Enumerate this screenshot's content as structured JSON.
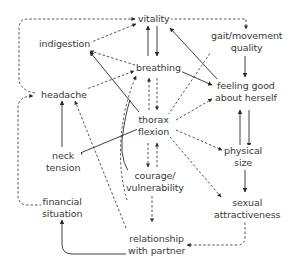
{
  "diagram": {
    "type": "causal concept map",
    "nodes": {
      "vitality": {
        "label": "vitality"
      },
      "indigestion": {
        "label": "indigestion"
      },
      "breathing": {
        "label": "breathing"
      },
      "headache": {
        "label": "headache"
      },
      "gait": {
        "line1": "gait/movement",
        "line2": "quality"
      },
      "feeling_good": {
        "line1": "feeling good",
        "line2": "about herself"
      },
      "thorax": {
        "line1": "thorax",
        "line2": "flexion"
      },
      "neck": {
        "line1": "neck",
        "line2": "tension"
      },
      "physical_size": {
        "line1": "physical",
        "line2": "size"
      },
      "courage": {
        "line1": "courage/",
        "line2": "vulnerability"
      },
      "financial": {
        "line1": "financial",
        "line2": "situation"
      },
      "sexual": {
        "line1": "sexual",
        "line2": "attractiveness"
      },
      "relationship": {
        "line1": "relationship",
        "line2": "with partner"
      }
    },
    "edges": [
      {
        "from": "breathing",
        "to": "vitality",
        "style": "solid"
      },
      {
        "from": "vitality",
        "to": "breathing",
        "style": "solid"
      },
      {
        "from": "breathing",
        "to": "indigestion",
        "style": "dashed"
      },
      {
        "from": "indigestion",
        "to": "vitality",
        "style": "dashed"
      },
      {
        "from": "headache",
        "to": "breathing",
        "style": "dashed"
      },
      {
        "from": "headache",
        "to": "vitality",
        "style": "dashed"
      },
      {
        "from": "vitality",
        "to": "gait/movement quality",
        "style": "dashed"
      },
      {
        "from": "breathing",
        "to": "thorax flexion",
        "style": "dashed"
      },
      {
        "from": "thorax flexion",
        "to": "breathing",
        "style": "dashed"
      },
      {
        "from": "thorax flexion",
        "to": "indigestion",
        "style": "solid"
      },
      {
        "from": "breathing",
        "to": "feeling good about herself",
        "style": "solid"
      },
      {
        "from": "feeling good about herself",
        "to": "vitality",
        "style": "solid"
      },
      {
        "from": "gait/movement quality",
        "to": "feeling good about herself",
        "style": "solid"
      },
      {
        "from": "thorax flexion",
        "to": "gait/movement quality",
        "style": "dashed"
      },
      {
        "from": "thorax flexion",
        "to": "feeling good about herself",
        "style": "dashed"
      },
      {
        "from": "feeling good about herself",
        "to": "physical size",
        "style": "solid"
      },
      {
        "from": "physical size",
        "to": "feeling good about herself",
        "style": "solid"
      },
      {
        "from": "thorax flexion",
        "to": "physical size",
        "style": "dashed"
      },
      {
        "from": "thorax flexion",
        "to": "sexual attractiveness",
        "style": "dashed"
      },
      {
        "from": "physical size",
        "to": "sexual attractiveness",
        "style": "solid"
      },
      {
        "from": "thorax flexion",
        "to": "neck tension",
        "style": "solid"
      },
      {
        "from": "neck tension",
        "to": "headache",
        "style": "solid"
      },
      {
        "from": "thorax flexion",
        "to": "courage/vulnerability",
        "style": "dashed"
      },
      {
        "from": "courage/vulnerability",
        "to": "thorax flexion",
        "style": "dashed"
      },
      {
        "from": "courage/vulnerability",
        "to": "breathing",
        "style": "dashed"
      },
      {
        "from": "courage/vulnerability",
        "to": "relationship with partner",
        "style": "dashed"
      },
      {
        "from": "relationship with partner",
        "to": "headache",
        "style": "dashed"
      },
      {
        "from": "sexual attractiveness",
        "to": "relationship with partner",
        "style": "dashed"
      },
      {
        "from": "relationship with partner",
        "to": "financial situation",
        "style": "solid"
      },
      {
        "from": "financial situation",
        "to": "headache",
        "style": "dashed"
      },
      {
        "from": "courage/vulnerability",
        "to": "thorax flexion (curved)",
        "style": "solid"
      }
    ]
  }
}
